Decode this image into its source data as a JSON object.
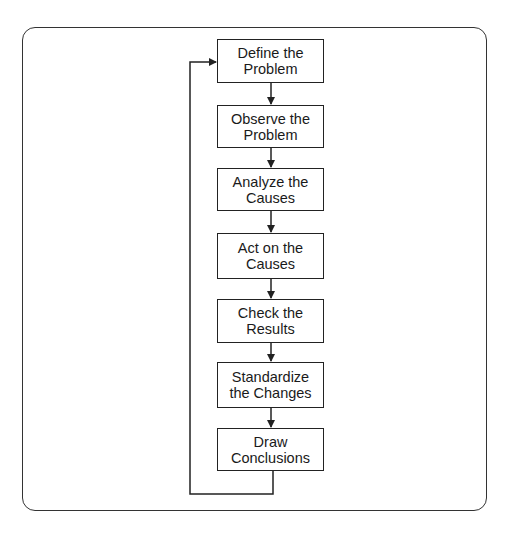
{
  "diagram": {
    "type": "flowchart",
    "direction": "top-to-bottom",
    "has_feedback_loop": true,
    "feedback_loop": {
      "from": "Draw Conclusions",
      "to": "Define the Problem"
    },
    "steps": [
      {
        "line1": "Define the",
        "line2": "Problem"
      },
      {
        "line1": "Observe the",
        "line2": "Problem"
      },
      {
        "line1": "Analyze the",
        "line2": "Causes"
      },
      {
        "line1": "Act on the",
        "line2": "Causes"
      },
      {
        "line1": "Check the",
        "line2": "Results"
      },
      {
        "line1": "Standardize",
        "line2": "the Changes"
      },
      {
        "line1": "Draw",
        "line2": "Conclusions"
      }
    ],
    "colors": {
      "line": "#222222",
      "frame": "#333333",
      "background": "#ffffff",
      "text": "#1a1a1a"
    }
  }
}
